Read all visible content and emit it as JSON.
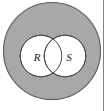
{
  "figure": {
    "type": "venn-diagram",
    "title": "Venn diagram of two overlapping sets R and S within a shaded universal set",
    "width": 104,
    "height": 111,
    "background_color": "#ffffff"
  },
  "universal_set": {
    "name": "universal-set",
    "shape": "circle",
    "fill_color": "#a8a8a8",
    "stroke_color": "#5b5b5b",
    "center_x": 52,
    "center_y": 51,
    "radius": 49,
    "clipped_top": true
  },
  "sets": [
    {
      "id": "set-r",
      "label": "R",
      "shape": "circle",
      "fill_color": "#ffffff",
      "stroke_color": "#4a4a4a",
      "center_x": 41,
      "center_y": 56,
      "radius": 21,
      "label_x": 37,
      "label_y": 58
    },
    {
      "id": "set-s",
      "label": "S",
      "shape": "circle",
      "fill_color": "#ffffff",
      "stroke_color": "#4a4a4a",
      "center_x": 65,
      "center_y": 56,
      "radius": 21,
      "label_x": 69,
      "label_y": 58
    }
  ],
  "intersection": {
    "name": "intersection-region",
    "fill_color": "#ffffff",
    "shaded": false
  },
  "frame": {
    "right_edge_color": "#5a5a5a",
    "right_edge_visible": true
  }
}
